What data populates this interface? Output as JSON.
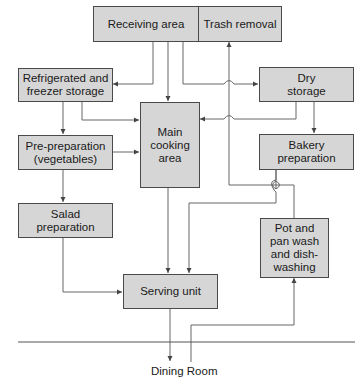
{
  "diagram": {
    "nodes": {
      "receiving": "Receiving area",
      "trash": "Trash removal",
      "refrigerated": "Refrigerated and\nfreezer storage",
      "dry": "Dry\nstorage",
      "main": "Main\ncooking\narea",
      "preprep": "Pre-preparation\n(vegetables)",
      "bakery": "Bakery\npreparation",
      "salad": "Salad\npreparation",
      "potpan": "Pot and\npan wash\nand dish-\nwashing",
      "serving": "Serving unit"
    },
    "dining_room": "Dining Room",
    "edges": [
      {
        "from": "Receiving area",
        "to": "Refrigerated and freezer storage"
      },
      {
        "from": "Receiving area",
        "to": "Main cooking area"
      },
      {
        "from": "Receiving area",
        "to": "Dry storage"
      },
      {
        "from": "Refrigerated and freezer storage",
        "to": "Pre-preparation (vegetables)"
      },
      {
        "from": "Refrigerated and freezer storage",
        "to": "Main cooking area"
      },
      {
        "from": "Dry storage",
        "to": "Main cooking area"
      },
      {
        "from": "Dry storage",
        "to": "Bakery preparation"
      },
      {
        "from": "Pre-preparation (vegetables)",
        "to": "Main cooking area"
      },
      {
        "from": "Pre-preparation (vegetables)",
        "to": "Salad preparation"
      },
      {
        "from": "Salad preparation",
        "to": "Serving unit"
      },
      {
        "from": "Main cooking area",
        "to": "Serving unit"
      },
      {
        "from": "Bakery preparation",
        "to": "Serving unit"
      },
      {
        "from": "Pot and pan wash and dish-washing",
        "to": "Trash removal"
      },
      {
        "from": "Serving unit",
        "to": "Dining Room"
      },
      {
        "from": "Dining Room",
        "to": "Pot and pan wash and dish-washing"
      }
    ],
    "colors": {
      "box_fill": "#d6d6d6",
      "box_border": "#4a4a4a",
      "line": "#555555"
    }
  }
}
